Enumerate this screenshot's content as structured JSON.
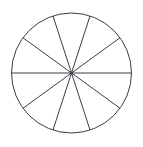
{
  "figure": {
    "shape": "circle",
    "center_x": 71.5,
    "center_y": 73,
    "radius": 60,
    "sector_count": 10,
    "sector_angle_degrees": 36,
    "divider_count": 5,
    "stroke_color": "#3c3c46",
    "fill_color": "#ffffff",
    "background_color": "#ffffff",
    "stroke_width": 1,
    "divider_angles_degrees": [
      0,
      36,
      72,
      108,
      144
    ],
    "sector_boundary_angles_degrees": [
      0,
      36,
      72,
      108,
      144,
      180,
      216,
      252,
      288,
      324
    ]
  }
}
